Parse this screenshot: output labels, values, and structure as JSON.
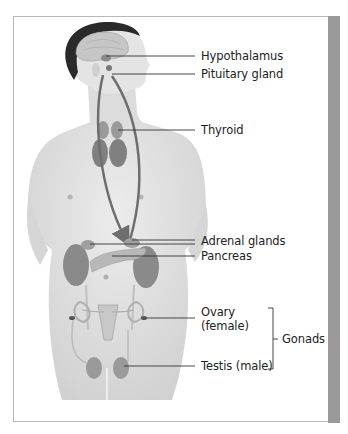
{
  "diagram": {
    "colors": {
      "frame_border": "#b8b8b8",
      "side_bar": "#9a9a9a",
      "skin": "#e3e3e3",
      "skin_shadow": "#cfcfcf",
      "hair": "#2a2a2a",
      "gland": "#7a7a7a",
      "arrow": "#6e6e6e",
      "leader_line": "#333333",
      "text": "#222222"
    },
    "labels": [
      {
        "id": "hypothalamus",
        "text": "Hypothalamus"
      },
      {
        "id": "pituitary",
        "text": "Pituitary gland"
      },
      {
        "id": "thyroid",
        "text": "Thyroid"
      },
      {
        "id": "adrenal",
        "text": "Adrenal glands"
      },
      {
        "id": "pancreas",
        "text": "Pancreas"
      },
      {
        "id": "ovary_line1",
        "text": "Ovary"
      },
      {
        "id": "ovary_line2",
        "text": "(female)"
      },
      {
        "id": "testis",
        "text": "Testis (male)"
      },
      {
        "id": "gonads",
        "text": "Gonads"
      }
    ]
  }
}
